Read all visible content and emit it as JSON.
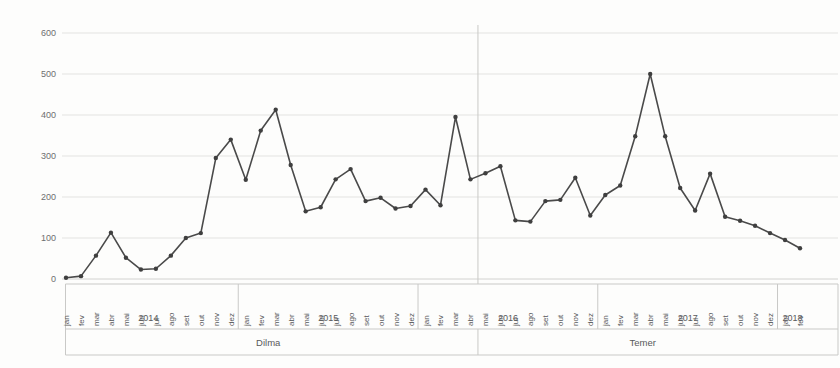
{
  "chart_data": {
    "type": "line",
    "title": "",
    "subtitle": "",
    "xlabel": "",
    "ylabel": "",
    "ylim": [
      0,
      600
    ],
    "y_ticks": [
      0,
      100,
      200,
      300,
      400,
      500,
      600
    ],
    "grid": true,
    "legend": null,
    "marker": "circle",
    "line_color": "#4a4a4a",
    "grid_color": "#e3e3e1",
    "text_color": "#58595b",
    "x": [
      "jan/2014",
      "fev/2014",
      "mar/2014",
      "abr/2014",
      "mai/2014",
      "jun/2014",
      "jul/2014",
      "ago/2014",
      "set/2014",
      "out/2014",
      "nov/2014",
      "dez/2014",
      "jan/2015",
      "fev/2015",
      "mar/2015",
      "abr/2015",
      "mai/2015",
      "jun/2015",
      "jul/2015",
      "ago/2015",
      "set/2015",
      "out/2015",
      "nov/2015",
      "dez/2015",
      "jan/2016",
      "fev/2016",
      "mar/2016",
      "abr/2016",
      "mai/2016",
      "jun/2016",
      "jul/2016",
      "ago/2016",
      "set/2016",
      "out/2016",
      "nov/2016",
      "dez/2016",
      "jan/2017",
      "fev/2017",
      "mar/2017",
      "abr/2017",
      "mai/2017",
      "jun/2017",
      "jul/2017",
      "ago/2017",
      "set/2017",
      "out/2017",
      "nov/2017",
      "dez/2017",
      "jan/2018",
      "fev/2018"
    ],
    "categories": [
      "jan",
      "fev",
      "mar",
      "abr",
      "mai",
      "jun",
      "jul",
      "ago",
      "set",
      "out",
      "nov",
      "dez",
      "jan",
      "fev",
      "mar",
      "abr",
      "mai",
      "jun",
      "jul",
      "ago",
      "set",
      "out",
      "nov",
      "dez",
      "jan",
      "fev",
      "mar",
      "abr",
      "mai",
      "jun",
      "jul",
      "ago",
      "set",
      "out",
      "nov",
      "dez",
      "jan",
      "fev",
      "mar",
      "abr",
      "mai",
      "jun",
      "jul",
      "ago",
      "set",
      "out",
      "nov",
      "dez",
      "jan",
      "fev"
    ],
    "values": [
      3,
      7,
      57,
      113,
      52,
      23,
      25,
      57,
      100,
      112,
      295,
      340,
      242,
      362,
      413,
      278,
      165,
      175,
      243,
      268,
      190,
      198,
      172,
      178,
      218,
      180,
      395,
      243,
      258,
      275,
      143,
      140,
      190,
      193,
      247,
      155,
      205,
      228,
      348,
      500,
      348,
      222,
      167,
      257,
      152,
      142,
      130,
      112,
      95,
      75
    ],
    "year_groups": [
      {
        "label": "2014",
        "start_index": 0,
        "count": 12
      },
      {
        "label": "2015",
        "start_index": 12,
        "count": 12
      },
      {
        "label": "2016",
        "start_index": 24,
        "count": 12
      },
      {
        "label": "2017",
        "start_index": 36,
        "count": 12
      },
      {
        "label": "2018",
        "start_index": 48,
        "count": 2
      }
    ],
    "government_groups": [
      {
        "label": "Dilma",
        "start_index": 0,
        "count": 28
      },
      {
        "label": "Temer",
        "start_index": 28,
        "count": 22
      }
    ],
    "annotations": []
  }
}
